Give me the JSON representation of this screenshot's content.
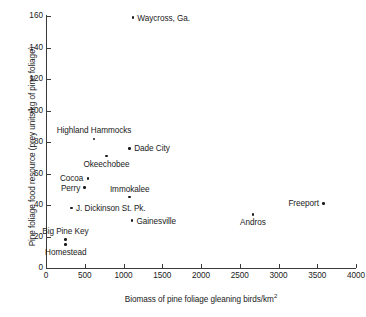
{
  "chart_data": {
    "type": "scatter",
    "title": "",
    "xlabel": "Biomass of pine foliage gleaning birds/km²",
    "ylabel": "Pine foliage food resource (prey units/kg of pine foliage)",
    "xlim": [
      0,
      4000
    ],
    "ylim": [
      0,
      160
    ],
    "xticks": [
      0,
      500,
      1000,
      1500,
      2000,
      2500,
      3000,
      3500,
      4000
    ],
    "yticks": [
      0,
      20,
      40,
      60,
      80,
      100,
      120,
      140,
      160
    ],
    "grid": false,
    "legend": false,
    "points": [
      {
        "label": "Waycross, Ga.",
        "x": 1120,
        "y": 159,
        "label_pos": "right"
      },
      {
        "label": "Highland Hammocks",
        "x": 620,
        "y": 82,
        "label_pos": "above"
      },
      {
        "label": "Dade City",
        "x": 1080,
        "y": 76,
        "label_pos": "right"
      },
      {
        "label": "Okeechobee",
        "x": 780,
        "y": 71,
        "label_pos": "below"
      },
      {
        "label": "Cocoa",
        "x": 540,
        "y": 57,
        "label_pos": "left"
      },
      {
        "label": "Perry",
        "x": 500,
        "y": 51,
        "label_pos": "left"
      },
      {
        "label": "Immokalee",
        "x": 1080,
        "y": 45,
        "label_pos": "above"
      },
      {
        "label": "Freeport",
        "x": 3580,
        "y": 41,
        "label_pos": "left"
      },
      {
        "label": "J. Dickinson St. Pk.",
        "x": 330,
        "y": 38,
        "label_pos": "right"
      },
      {
        "label": "Andros",
        "x": 2670,
        "y": 34,
        "label_pos": "below"
      },
      {
        "label": "Gainesville",
        "x": 1110,
        "y": 30,
        "label_pos": "right"
      },
      {
        "label": "Big Pine Key",
        "x": 250,
        "y": 18,
        "label_pos": "above"
      },
      {
        "label": "Homestead",
        "x": 255,
        "y": 15,
        "label_pos": "below"
      }
    ]
  },
  "axes": {
    "x_tick_labels": [
      "0",
      "500",
      "1000",
      "1500",
      "2000",
      "2500",
      "3000",
      "3500",
      "4000"
    ],
    "y_tick_labels": [
      "0",
      "20",
      "40",
      "60",
      "80",
      "100",
      "120",
      "140",
      "160"
    ],
    "x_axis_title": "Biomass of pine foliage gleaning birds/km²",
    "y_axis_title": "Pine foliage food resource (prey units/kg of pine foliage)"
  },
  "colors": {
    "background": "#ffffff",
    "axis": "#3a3a3a",
    "marker": "#1a1a1a",
    "text": "#1a1a1a"
  }
}
